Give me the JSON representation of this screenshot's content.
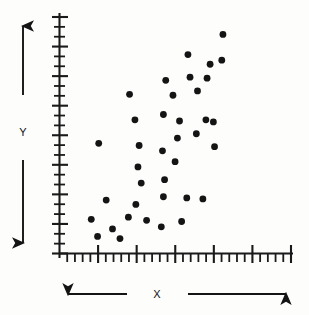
{
  "chart_data": {
    "type": "scatter",
    "title": "",
    "xlabel": "X",
    "ylabel": "Y",
    "xlim": [
      0,
      100
    ],
    "ylim": [
      0,
      100
    ],
    "grid": false,
    "legend": null,
    "marker": {
      "shape": "circle",
      "color": "#141414",
      "size": 3.4
    },
    "axis": {
      "color": "#1a1a1a",
      "x_major_ticks": 6,
      "x_minor_per_major": 4,
      "y_major_ticks": 8,
      "y_minor_per_major": 2,
      "tick_labels_shown": false,
      "description": "Unlabeled quantitative axes with major and minor tick marks; direction arrows indicate increasing X to the right and increasing Y upward."
    },
    "relationship": "positive correlation",
    "n_points": 38,
    "points": [
      {
        "x": 16.3,
        "y": 7.1
      },
      {
        "x": 13.6,
        "y": 14.2
      },
      {
        "x": 22.7,
        "y": 10.2
      },
      {
        "x": 25.9,
        "y": 6.2
      },
      {
        "x": 20.0,
        "y": 22.2
      },
      {
        "x": 29.5,
        "y": 15.1
      },
      {
        "x": 32.7,
        "y": 20.4
      },
      {
        "x": 16.8,
        "y": 45.8
      },
      {
        "x": 35.0,
        "y": 29.3
      },
      {
        "x": 37.3,
        "y": 13.8
      },
      {
        "x": 34.1,
        "y": 44.9
      },
      {
        "x": 33.6,
        "y": 36.0
      },
      {
        "x": 32.3,
        "y": 55.6
      },
      {
        "x": 30.0,
        "y": 66.2
      },
      {
        "x": 43.6,
        "y": 11.1
      },
      {
        "x": 44.5,
        "y": 23.6
      },
      {
        "x": 45.0,
        "y": 30.7
      },
      {
        "x": 44.1,
        "y": 42.7
      },
      {
        "x": 44.5,
        "y": 57.8
      },
      {
        "x": 45.5,
        "y": 72.0
      },
      {
        "x": 49.5,
        "y": 38.2
      },
      {
        "x": 50.5,
        "y": 48.0
      },
      {
        "x": 48.6,
        "y": 65.8
      },
      {
        "x": 51.4,
        "y": 55.1
      },
      {
        "x": 52.3,
        "y": 13.3
      },
      {
        "x": 55.0,
        "y": 82.7
      },
      {
        "x": 55.9,
        "y": 73.3
      },
      {
        "x": 54.5,
        "y": 23.1
      },
      {
        "x": 58.6,
        "y": 49.8
      },
      {
        "x": 59.1,
        "y": 67.6
      },
      {
        "x": 61.4,
        "y": 22.7
      },
      {
        "x": 62.7,
        "y": 55.6
      },
      {
        "x": 63.2,
        "y": 72.9
      },
      {
        "x": 64.5,
        "y": 78.7
      },
      {
        "x": 66.4,
        "y": 44.4
      },
      {
        "x": 65.9,
        "y": 54.7
      },
      {
        "x": 69.5,
        "y": 80.4
      },
      {
        "x": 70.0,
        "y": 91.1
      }
    ]
  },
  "annotations": {
    "y_axis_label": "Y",
    "x_axis_label": "X",
    "y_arrow_up": "arrow-up",
    "y_arrow_down": "arrow-down",
    "x_arrow_left": "arrow-left",
    "x_arrow_right": "arrow-right"
  },
  "colors": {
    "ink": "#141414",
    "axis": "#1a1a1a",
    "background": "#fdfdfc"
  }
}
